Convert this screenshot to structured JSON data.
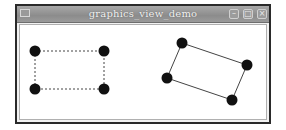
{
  "window": {
    "title": "graphics_view_demo",
    "buttons": {
      "minimize": "minimize-icon",
      "maximize": "maximize-icon",
      "close": "close-icon"
    }
  },
  "scene": {
    "left_rect": {
      "style": "dashed",
      "points": [
        [
          35,
          51
        ],
        [
          104,
          51
        ],
        [
          104,
          89
        ],
        [
          35,
          89
        ]
      ]
    },
    "right_rect": {
      "style": "solid",
      "points": [
        [
          182,
          43
        ],
        [
          247,
          65
        ],
        [
          232,
          100
        ],
        [
          167,
          78
        ]
      ]
    },
    "dot_color": "#111111",
    "line_color": "#444444"
  }
}
